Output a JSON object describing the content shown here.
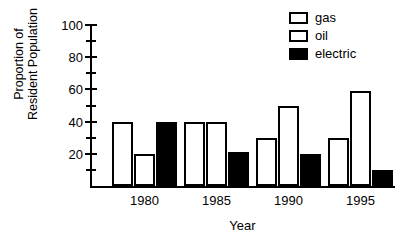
{
  "chart_data": {
    "type": "bar",
    "title": "",
    "xlabel": "Year",
    "ylabel": "Proportion of Resident Population",
    "ylabel_lines": [
      "Proportion of",
      "Resident Population"
    ],
    "categories": [
      "1980",
      "1985",
      "1990",
      "1995"
    ],
    "series": [
      {
        "name": "gas",
        "values": [
          40,
          40,
          30,
          30
        ],
        "fill": "#ffffff",
        "stroke": "#000000"
      },
      {
        "name": "oil",
        "values": [
          20,
          40,
          50,
          59
        ],
        "fill": "#ffffff",
        "stroke": "#000000"
      },
      {
        "name": "electric",
        "values": [
          40,
          21,
          20,
          10
        ],
        "fill": "#000000",
        "stroke": "#000000"
      }
    ],
    "ylim": [
      0,
      100
    ],
    "y_major_ticks": [
      20,
      40,
      60,
      80,
      100
    ],
    "y_minor_ticks": [
      10,
      30,
      50,
      70,
      90
    ],
    "y_tick_labels": [
      "20",
      "40",
      "60",
      "80",
      "100"
    ],
    "grid": false,
    "legend_position": "top-right",
    "legend": [
      "gas",
      "oil",
      "electric"
    ]
  }
}
